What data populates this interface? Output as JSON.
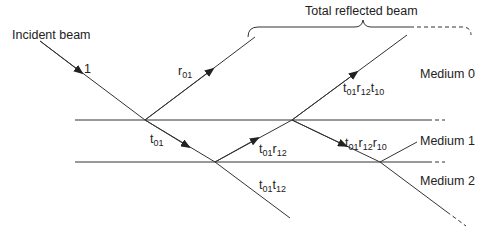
{
  "diagram": {
    "brace_label": "Total reflected beam",
    "incident_label": "Incident beam",
    "incident_amplitude": "1",
    "media": [
      {
        "name": "Medium 0"
      },
      {
        "name": "Medium 1"
      },
      {
        "name": "Medium 2"
      }
    ],
    "beams": [
      {
        "id": "r01",
        "base": "r",
        "sub": "01"
      },
      {
        "id": "t01",
        "base": "t",
        "sub": "01"
      },
      {
        "id": "t01r12",
        "parts": [
          {
            "b": "t",
            "s": "01"
          },
          {
            "b": "r",
            "s": "12"
          }
        ]
      },
      {
        "id": "t01t12",
        "parts": [
          {
            "b": "t",
            "s": "01"
          },
          {
            "b": "t",
            "s": "12"
          }
        ]
      },
      {
        "id": "t01r12t10",
        "parts": [
          {
            "b": "t",
            "s": "01"
          },
          {
            "b": "r",
            "s": "12"
          },
          {
            "b": "t",
            "s": "10"
          }
        ]
      },
      {
        "id": "t01r12r10",
        "parts": [
          {
            "b": "t",
            "s": "01"
          },
          {
            "b": "r",
            "s": "12"
          },
          {
            "b": "r",
            "s": "10"
          }
        ]
      }
    ],
    "line_color": "#333333"
  }
}
